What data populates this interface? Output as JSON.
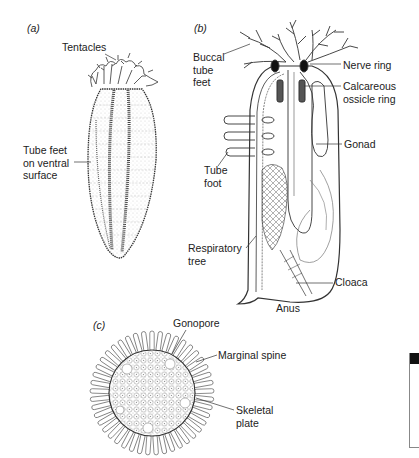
{
  "figure": {
    "panels": [
      {
        "id": "a",
        "tag": "(a)",
        "labels": [
          "Tentacles",
          "Tube feet\non ventral\nsurface"
        ]
      },
      {
        "id": "b",
        "tag": "(b)",
        "labels": [
          "Buccal\ntube\nfeet",
          "Nerve ring",
          "Calcareous\nossicle ring",
          "Gonad",
          "Tube\nfoot",
          "Respiratory\ntree",
          "Cloaca",
          "Anus"
        ]
      },
      {
        "id": "c",
        "tag": "(c)",
        "labels": [
          "Gonopore",
          "Marginal spine",
          "Skeletal\nplate"
        ]
      }
    ]
  },
  "colors": {
    "ink": "#222222",
    "shade": "#9a9a9a",
    "background": "#ffffff"
  }
}
